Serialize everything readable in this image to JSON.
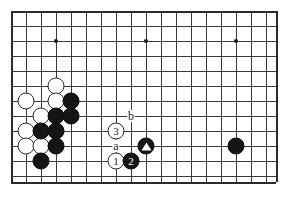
{
  "diagram": {
    "board": {
      "line_color": "#3a3a3a",
      "edge_color": "#2a2a2a",
      "background": "#ffffff",
      "cell_size": 15,
      "origin_x": 11,
      "origin_y": 11,
      "cols": 18,
      "rows": 12,
      "hoshi": [
        {
          "name": "star-point-left",
          "col": 3,
          "row": 2
        },
        {
          "name": "star-point-center",
          "col": 9,
          "row": 2
        },
        {
          "name": "star-point-right",
          "col": 15,
          "row": 2
        }
      ]
    },
    "stones": [
      {
        "id": "w-a1",
        "color": "white",
        "col": 3,
        "row": 5,
        "label": ""
      },
      {
        "id": "w-a2",
        "color": "white",
        "col": 1,
        "row": 6,
        "label": ""
      },
      {
        "id": "w-a3",
        "color": "white",
        "col": 3,
        "row": 6,
        "label": ""
      },
      {
        "id": "w-a4",
        "color": "white",
        "col": 2,
        "row": 7,
        "label": ""
      },
      {
        "id": "w-a5",
        "color": "white",
        "col": 1,
        "row": 8,
        "label": ""
      },
      {
        "id": "w-a6",
        "color": "white",
        "col": 1,
        "row": 9,
        "label": ""
      },
      {
        "id": "w-a7",
        "color": "white",
        "col": 2,
        "row": 9,
        "label": ""
      },
      {
        "id": "b-a1",
        "color": "black",
        "col": 4,
        "row": 6,
        "label": ""
      },
      {
        "id": "b-a2",
        "color": "black",
        "col": 3,
        "row": 7,
        "label": ""
      },
      {
        "id": "b-a3",
        "color": "black",
        "col": 4,
        "row": 7,
        "label": ""
      },
      {
        "id": "b-a4",
        "color": "black",
        "col": 2,
        "row": 8,
        "label": ""
      },
      {
        "id": "b-a5",
        "color": "black",
        "col": 3,
        "row": 8,
        "label": ""
      },
      {
        "id": "b-a6",
        "color": "black",
        "col": 3,
        "row": 9,
        "label": ""
      },
      {
        "id": "b-a7",
        "color": "black",
        "col": 2,
        "row": 10,
        "label": ""
      },
      {
        "id": "b-right",
        "color": "black",
        "col": 15,
        "row": 9,
        "label": ""
      },
      {
        "id": "move-3",
        "color": "white",
        "col": 7,
        "row": 8,
        "label": "3"
      },
      {
        "id": "move-1",
        "color": "white",
        "col": 7,
        "row": 10,
        "label": "1"
      },
      {
        "id": "move-2",
        "color": "black",
        "col": 8,
        "row": 10,
        "label": "2"
      }
    ],
    "marked_stones": [
      {
        "id": "marked-triangle",
        "color": "black",
        "col": 9,
        "row": 9,
        "marker": "triangle"
      }
    ],
    "point_labels": [
      {
        "id": "label-b",
        "text": "b",
        "col": 8,
        "row": 7
      },
      {
        "id": "label-a",
        "text": "a",
        "col": 7,
        "row": 9
      }
    ]
  }
}
